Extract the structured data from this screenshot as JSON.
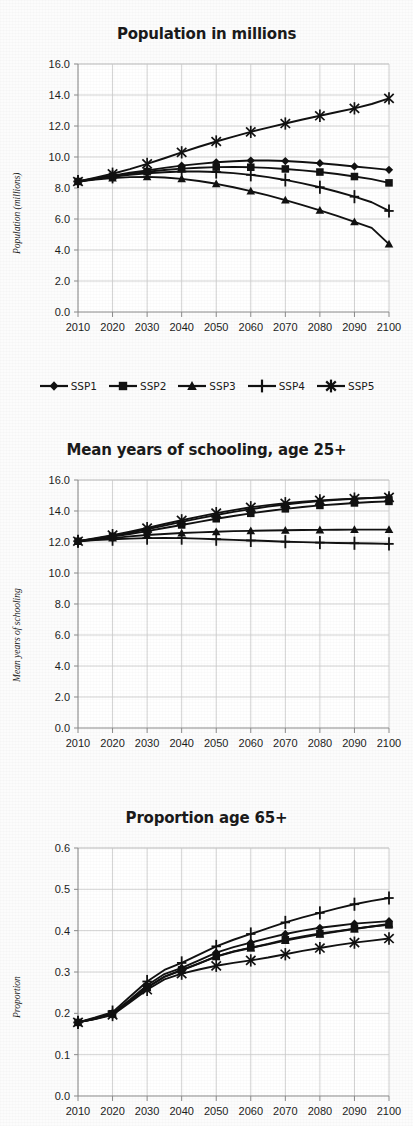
{
  "page": {
    "background": "#fcfcfc",
    "ink": "#111111",
    "gridline_color": "#c8c8c8",
    "axis_color": "#8a8a8a"
  },
  "legend": {
    "items": [
      {
        "label": "SSP1",
        "marker": "diamond"
      },
      {
        "label": "SSP2",
        "marker": "square"
      },
      {
        "label": "SSP3",
        "marker": "triangle"
      },
      {
        "label": "SSP4",
        "marker": "plus"
      },
      {
        "label": "SSP5",
        "marker": "asterisk"
      }
    ]
  },
  "chart_data": [
    {
      "id": "population",
      "type": "line",
      "title": "Population in millions",
      "xlabel": "",
      "ylabel": "Population (millions)",
      "xlim": [
        2010,
        2100
      ],
      "ylim": [
        0.0,
        16.0
      ],
      "ytick_step": 2.0,
      "grid": true,
      "legend_position": "bottom",
      "x": [
        2010,
        2015,
        2020,
        2025,
        2030,
        2035,
        2040,
        2045,
        2050,
        2055,
        2060,
        2065,
        2070,
        2075,
        2080,
        2085,
        2090,
        2095,
        2100
      ],
      "xticklabels": [
        "2010",
        "2020",
        "2030",
        "2040",
        "2050",
        "2060",
        "2070",
        "2080",
        "2090",
        "2100"
      ],
      "yticklabels": [
        "0.0",
        "2.0",
        "4.0",
        "6.0",
        "8.0",
        "10.0",
        "12.0",
        "14.0",
        "16.0"
      ],
      "series": [
        {
          "name": "SSP1",
          "marker": "diamond",
          "values": [
            8.42,
            8.62,
            8.8,
            8.98,
            9.14,
            9.3,
            9.44,
            9.56,
            9.66,
            9.73,
            9.77,
            9.77,
            9.74,
            9.68,
            9.6,
            9.5,
            9.39,
            9.28,
            9.17
          ]
        },
        {
          "name": "SSP2",
          "marker": "square",
          "values": [
            8.42,
            8.6,
            8.76,
            8.92,
            9.05,
            9.16,
            9.25,
            9.31,
            9.35,
            9.36,
            9.34,
            9.3,
            9.23,
            9.14,
            9.03,
            8.9,
            8.74,
            8.57,
            8.33
          ]
        },
        {
          "name": "SSP3",
          "marker": "triangle",
          "values": [
            8.42,
            8.55,
            8.64,
            8.7,
            8.72,
            8.68,
            8.59,
            8.45,
            8.27,
            8.05,
            7.8,
            7.52,
            7.22,
            6.9,
            6.56,
            6.2,
            5.82,
            5.43,
            4.38
          ]
        },
        {
          "name": "SSP4",
          "marker": "plus",
          "values": [
            8.42,
            8.58,
            8.72,
            8.85,
            8.95,
            9.02,
            9.06,
            9.06,
            9.03,
            8.96,
            8.85,
            8.7,
            8.52,
            8.3,
            8.05,
            7.76,
            7.44,
            7.08,
            6.52
          ]
        },
        {
          "name": "SSP5",
          "marker": "asterisk",
          "values": [
            8.42,
            8.66,
            8.92,
            9.22,
            9.56,
            9.92,
            10.3,
            10.66,
            11.0,
            11.32,
            11.62,
            11.9,
            12.16,
            12.42,
            12.66,
            12.9,
            13.14,
            13.42,
            13.78
          ]
        }
      ]
    },
    {
      "id": "schooling",
      "type": "line",
      "title": "Mean years of schooling, age 25+",
      "xlabel": "",
      "ylabel": "Mean years of schooling",
      "xlim": [
        2010,
        2100
      ],
      "ylim": [
        0.0,
        16.0
      ],
      "ytick_step": 2.0,
      "grid": true,
      "legend_position": "none",
      "x": [
        2010,
        2015,
        2020,
        2025,
        2030,
        2035,
        2040,
        2045,
        2050,
        2055,
        2060,
        2065,
        2070,
        2075,
        2080,
        2085,
        2090,
        2095,
        2100
      ],
      "xticklabels": [
        "2010",
        "2020",
        "2030",
        "2040",
        "2050",
        "2060",
        "2070",
        "2080",
        "2090",
        "2100"
      ],
      "yticklabels": [
        "0.0",
        "2.0",
        "4.0",
        "6.0",
        "8.0",
        "10.0",
        "12.0",
        "14.0",
        "16.0"
      ],
      "series": [
        {
          "name": "SSP1",
          "marker": "diamond",
          "values": [
            12.05,
            12.22,
            12.4,
            12.6,
            12.82,
            13.06,
            13.3,
            13.52,
            13.74,
            13.94,
            14.12,
            14.28,
            14.42,
            14.54,
            14.64,
            14.72,
            14.79,
            14.85,
            14.9
          ]
        },
        {
          "name": "SSP2",
          "marker": "square",
          "values": [
            12.05,
            12.2,
            12.35,
            12.52,
            12.7,
            12.9,
            13.1,
            13.3,
            13.5,
            13.68,
            13.85,
            14.0,
            14.14,
            14.26,
            14.36,
            14.44,
            14.52,
            14.58,
            14.62
          ]
        },
        {
          "name": "SSP3",
          "marker": "triangle",
          "values": [
            12.05,
            12.15,
            12.25,
            12.36,
            12.45,
            12.52,
            12.58,
            12.62,
            12.66,
            12.7,
            12.72,
            12.74,
            12.76,
            12.77,
            12.78,
            12.79,
            12.8,
            12.8,
            12.8
          ]
        },
        {
          "name": "SSP4",
          "marker": "plus",
          "values": [
            12.05,
            12.12,
            12.18,
            12.22,
            12.25,
            12.26,
            12.25,
            12.22,
            12.18,
            12.14,
            12.1,
            12.06,
            12.02,
            11.99,
            11.96,
            11.94,
            11.92,
            11.9,
            11.88
          ]
        },
        {
          "name": "SSP5",
          "marker": "asterisk",
          "values": [
            12.05,
            12.24,
            12.44,
            12.66,
            12.9,
            13.16,
            13.4,
            13.64,
            13.86,
            14.06,
            14.24,
            14.38,
            14.5,
            14.6,
            14.68,
            14.75,
            14.8,
            14.84,
            14.88
          ]
        }
      ]
    },
    {
      "id": "proportion65",
      "type": "line",
      "title": "Proportion age 65+",
      "xlabel": "",
      "ylabel": "Proportion",
      "xlim": [
        2010,
        2100
      ],
      "ylim": [
        0.0,
        0.6
      ],
      "ytick_step": 0.1,
      "grid": true,
      "legend_position": "none",
      "x": [
        2010,
        2015,
        2020,
        2025,
        2030,
        2035,
        2040,
        2045,
        2050,
        2055,
        2060,
        2065,
        2070,
        2075,
        2080,
        2085,
        2090,
        2095,
        2100
      ],
      "xticklabels": [
        "2010",
        "2020",
        "2030",
        "2040",
        "2050",
        "2060",
        "2070",
        "2080",
        "2090",
        "2100"
      ],
      "yticklabels": [
        "0.0",
        "0.1",
        "0.2",
        "0.3",
        "0.4",
        "0.5",
        "0.6"
      ],
      "series": [
        {
          "name": "SSP1",
          "marker": "diamond",
          "values": [
            0.178,
            0.188,
            0.2,
            0.233,
            0.268,
            0.295,
            0.31,
            0.328,
            0.347,
            0.36,
            0.371,
            0.382,
            0.392,
            0.4,
            0.407,
            0.412,
            0.417,
            0.42,
            0.423
          ]
        },
        {
          "name": "SSP2",
          "marker": "square",
          "values": [
            0.178,
            0.187,
            0.199,
            0.23,
            0.263,
            0.289,
            0.305,
            0.321,
            0.338,
            0.35,
            0.359,
            0.368,
            0.378,
            0.386,
            0.393,
            0.399,
            0.405,
            0.41,
            0.414
          ]
        },
        {
          "name": "SSP3",
          "marker": "triangle",
          "values": [
            0.178,
            0.187,
            0.198,
            0.229,
            0.262,
            0.288,
            0.304,
            0.32,
            0.337,
            0.349,
            0.358,
            0.367,
            0.376,
            0.384,
            0.391,
            0.398,
            0.404,
            0.41,
            0.416
          ]
        },
        {
          "name": "SSP4",
          "marker": "plus",
          "values": [
            0.178,
            0.19,
            0.203,
            0.24,
            0.277,
            0.305,
            0.322,
            0.342,
            0.362,
            0.378,
            0.392,
            0.406,
            0.42,
            0.432,
            0.443,
            0.454,
            0.464,
            0.472,
            0.479
          ]
        },
        {
          "name": "SSP5",
          "marker": "asterisk",
          "values": [
            0.178,
            0.186,
            0.196,
            0.226,
            0.257,
            0.282,
            0.296,
            0.306,
            0.315,
            0.322,
            0.328,
            0.335,
            0.343,
            0.351,
            0.358,
            0.365,
            0.371,
            0.376,
            0.381
          ]
        }
      ]
    }
  ]
}
